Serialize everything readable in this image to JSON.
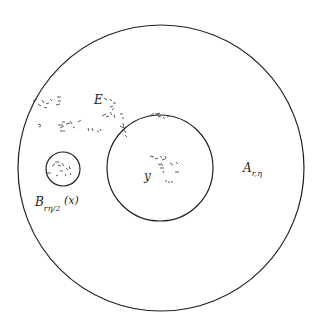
{
  "diagram": {
    "outer_label": "A",
    "outer_sub": "r,η",
    "ball_label": "B",
    "ball_sub": "rη/2",
    "ball_arg": "(x)",
    "set_label": "E",
    "center_label": "y",
    "stroke_color": "#222222",
    "background": "#ffffff"
  }
}
